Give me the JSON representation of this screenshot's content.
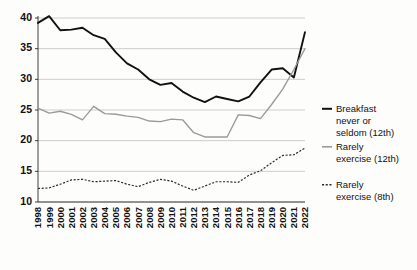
{
  "chart_data": {
    "type": "line",
    "title": "",
    "subtitle": "",
    "xlabel": "",
    "ylabel": "",
    "grid": true,
    "legend_position": "right",
    "xlim": [
      1998,
      2022
    ],
    "ylim": [
      10,
      40
    ],
    "yticks": [
      10,
      15,
      20,
      25,
      30,
      35,
      40
    ],
    "ytick_labels": [
      "10",
      "15",
      "20",
      "25",
      "30",
      "35",
      "40"
    ],
    "x": [
      1998,
      1999,
      2000,
      2001,
      2002,
      2003,
      2004,
      2005,
      2006,
      2007,
      2008,
      2009,
      2010,
      2011,
      2012,
      2013,
      2014,
      2015,
      2016,
      2017,
      2018,
      2019,
      2020,
      2021,
      2022
    ],
    "categories": [
      "1998",
      "1999",
      "2000",
      "2001",
      "2002",
      "2003",
      "2004",
      "2005",
      "2006",
      "2007",
      "2008",
      "2009",
      "2010",
      "2011",
      "2012",
      "2013",
      "2014",
      "2015",
      "2016",
      "2017",
      "2018",
      "2019",
      "2020",
      "2021",
      "2022"
    ],
    "series": [
      {
        "name": "Breakfast never or seldom (12th)",
        "style": "solid-black",
        "color": "#111111",
        "values": [
          39.2,
          40.3,
          38.0,
          38.1,
          38.4,
          37.2,
          36.6,
          34.4,
          32.6,
          31.6,
          30.0,
          29.1,
          29.4,
          28.0,
          27.0,
          26.3,
          27.2,
          26.8,
          26.4,
          27.2,
          29.5,
          31.6,
          31.8,
          30.3,
          37.7
        ]
      },
      {
        "name": "Rarely exercise (12th)",
        "style": "solid-gray",
        "color": "#9a9a9a",
        "values": [
          25.3,
          24.5,
          24.8,
          24.3,
          23.4,
          25.6,
          24.4,
          24.3,
          24.0,
          23.8,
          23.2,
          23.1,
          23.5,
          23.4,
          21.3,
          20.6,
          20.6,
          20.6,
          24.2,
          24.1,
          23.6,
          25.9,
          28.4,
          31.6,
          35.0
        ]
      },
      {
        "name": "Rarely exercise (8th)",
        "style": "dashed",
        "color": "#2b2b2b",
        "values": [
          12.2,
          12.3,
          12.9,
          13.6,
          13.7,
          13.3,
          13.4,
          13.5,
          12.9,
          12.5,
          13.2,
          13.7,
          13.4,
          12.6,
          11.9,
          12.6,
          13.3,
          13.3,
          13.2,
          14.4,
          15.1,
          16.4,
          17.6,
          17.7,
          18.8
        ]
      }
    ],
    "legend": [
      {
        "label_lines": [
          "Breakfast",
          "never or",
          "seldom (12th)"
        ],
        "style": "solid-black"
      },
      {
        "label_lines": [
          "Rarely",
          "exercise (12th)"
        ],
        "style": "solid-gray"
      },
      {
        "label_lines": [
          "Rarely",
          "exercise (8th)"
        ],
        "style": "dashed"
      }
    ]
  }
}
